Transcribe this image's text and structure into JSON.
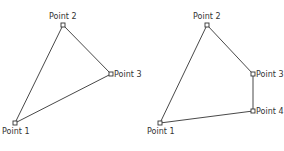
{
  "colors": {
    "stroke": "#333333",
    "label": "#333333",
    "background": "#ffffff"
  },
  "diagrams": [
    {
      "name": "triangle",
      "points": [
        {
          "label": "Point 1",
          "x": 15,
          "y": 123
        },
        {
          "label": "Point 2",
          "x": 63,
          "y": 25
        },
        {
          "label": "Point 3",
          "x": 111,
          "y": 74
        }
      ]
    },
    {
      "name": "quadrilateral",
      "points": [
        {
          "label": "Point 1",
          "x": 160,
          "y": 123
        },
        {
          "label": "Point 2",
          "x": 207,
          "y": 25
        },
        {
          "label": "Point 3",
          "x": 253,
          "y": 74
        },
        {
          "label": "Point 4",
          "x": 253,
          "y": 111
        }
      ]
    }
  ]
}
